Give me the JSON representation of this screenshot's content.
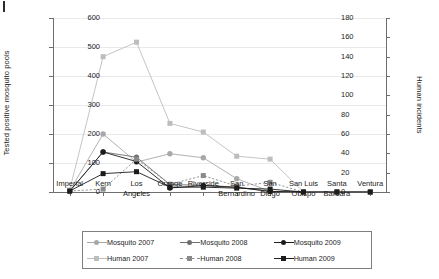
{
  "chart_data": {
    "type": "line",
    "title": "",
    "xlabel": "",
    "ylabel": "Tested positive mosquito pools",
    "y2label": "Human incidents",
    "categories": [
      "Imperial",
      "Kern",
      "Los Angeles",
      "Orange",
      "Riverside",
      "San Bernardino",
      "San Diego",
      "San Luis Obispo",
      "Santa Barbara",
      "Ventura"
    ],
    "ylim": [
      0,
      600
    ],
    "yticks": [
      0,
      100,
      200,
      300,
      400,
      500,
      600
    ],
    "y2lim": [
      0,
      180
    ],
    "y2ticks": [
      0,
      20,
      40,
      60,
      80,
      100,
      120,
      140,
      160,
      180
    ],
    "grid": true,
    "legend_position": "bottom",
    "series": [
      {
        "name": "Mosquito 2007",
        "axis": "left",
        "color": "#a8a8a8",
        "marker": "circle",
        "dash": "solid",
        "values": [
          4,
          200,
          103,
          132,
          118,
          46,
          2,
          0,
          0,
          0
        ]
      },
      {
        "name": "Mosquito 2008",
        "axis": "left",
        "color": "#6f6f6f",
        "marker": "circle",
        "dash": "solid",
        "values": [
          3,
          138,
          120,
          26,
          23,
          17,
          2,
          0,
          0,
          0
        ]
      },
      {
        "name": "Mosquito 2009",
        "axis": "left",
        "color": "#1c1c1c",
        "marker": "circle",
        "dash": "solid",
        "values": [
          3,
          138,
          105,
          14,
          22,
          16,
          2,
          0,
          0,
          0
        ]
      },
      {
        "name": "Human 2007",
        "axis": "right",
        "color": "#bdbdbd",
        "marker": "square",
        "dash": "solid",
        "values": [
          2,
          140,
          155,
          71,
          62,
          37,
          34,
          0,
          0,
          0
        ]
      },
      {
        "name": "Human 2008",
        "axis": "right",
        "color": "#8a8a8a",
        "marker": "square",
        "dash": "dashed",
        "values": [
          1,
          3,
          34,
          8,
          17,
          6,
          10,
          0,
          0,
          0
        ]
      },
      {
        "name": "Human 2009",
        "axis": "right",
        "color": "#1c1c1c",
        "marker": "square",
        "dash": "solid",
        "values": [
          1,
          19,
          21,
          5,
          5,
          4,
          3,
          0,
          0,
          0
        ]
      }
    ]
  },
  "legend": {
    "entries": [
      {
        "label": "Mosquito 2007"
      },
      {
        "label": "Mosquito 2008"
      },
      {
        "label": "Mosquito 2009"
      },
      {
        "label": "Human 2007"
      },
      {
        "label": "Human 2008"
      },
      {
        "label": "Human 2009"
      }
    ]
  }
}
